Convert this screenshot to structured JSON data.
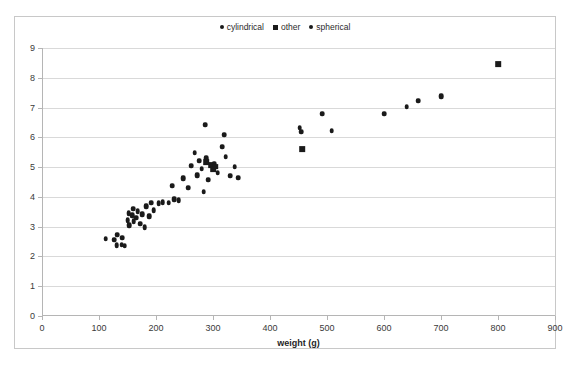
{
  "chart_data": {
    "type": "scatter",
    "title": "",
    "xlabel": "weight (g)",
    "ylabel": "",
    "xlim": [
      0,
      900
    ],
    "ylim": [
      0,
      9
    ],
    "xticks": [
      0,
      100,
      200,
      300,
      400,
      500,
      600,
      700,
      800,
      900
    ],
    "yticks": [
      0,
      1,
      2,
      3,
      4,
      5,
      6,
      7,
      8,
      9
    ],
    "grid": "horizontal",
    "legend_position": "top-center",
    "marker_color": "#1a1a1a",
    "series": [
      {
        "name": "cylindrical",
        "marker": "circle",
        "points": [
          [
            112,
            2.6
          ],
          [
            127,
            2.55
          ],
          [
            131,
            2.38
          ],
          [
            132,
            2.72
          ],
          [
            140,
            2.4
          ],
          [
            141,
            2.62
          ],
          [
            145,
            2.35
          ],
          [
            150,
            3.22
          ],
          [
            152,
            3.45
          ],
          [
            153,
            3.05
          ],
          [
            158,
            3.38
          ],
          [
            160,
            3.6
          ],
          [
            161,
            3.18
          ],
          [
            165,
            3.3
          ],
          [
            168,
            3.52
          ],
          [
            172,
            3.1
          ],
          [
            176,
            3.42
          ],
          [
            180,
            2.98
          ],
          [
            183,
            3.68
          ],
          [
            188,
            3.35
          ],
          [
            192,
            3.8
          ],
          [
            196,
            3.55
          ],
          [
            205,
            3.78
          ],
          [
            212,
            3.82
          ],
          [
            222,
            3.8
          ],
          [
            228,
            4.38
          ],
          [
            232,
            3.92
          ],
          [
            240,
            3.88
          ],
          [
            248,
            4.62
          ],
          [
            256,
            4.3
          ],
          [
            262,
            5.05
          ],
          [
            268,
            5.48
          ],
          [
            272,
            4.72
          ],
          [
            276,
            5.22
          ],
          [
            280,
            4.95
          ],
          [
            284,
            4.18
          ],
          [
            288,
            5.3
          ],
          [
            292,
            4.58
          ],
          [
            302,
            5.12
          ],
          [
            308,
            4.8
          ],
          [
            316,
            5.68
          ],
          [
            322,
            5.35
          ],
          [
            330,
            4.7
          ],
          [
            338,
            5.02
          ],
          [
            344,
            4.65
          ],
          [
            286,
            6.42
          ],
          [
            320,
            6.08
          ],
          [
            452,
            6.32
          ],
          [
            455,
            6.18
          ],
          [
            492,
            6.78
          ],
          [
            508,
            6.22
          ],
          [
            600,
            6.8
          ],
          [
            640,
            7.02
          ],
          [
            660,
            7.22
          ],
          [
            700,
            7.38
          ]
        ]
      },
      {
        "name": "other",
        "marker": "square",
        "points": [
          [
            288,
            5.18
          ],
          [
            296,
            5.08
          ],
          [
            300,
            4.92
          ],
          [
            304,
            5.02
          ],
          [
            456,
            5.6
          ],
          [
            800,
            8.45
          ]
        ]
      },
      {
        "name": "spherical",
        "marker": "circle",
        "points": []
      }
    ]
  },
  "legend": {
    "items": [
      {
        "label": "cylindrical",
        "marker": "circle"
      },
      {
        "label": "other",
        "marker": "square"
      },
      {
        "label": "spherical",
        "marker": "circle"
      }
    ]
  }
}
